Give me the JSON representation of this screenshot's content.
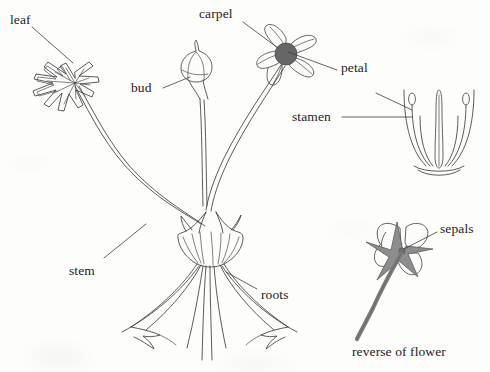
{
  "figure": {
    "caption": "reverse of flower",
    "background_color": "#fdfdfc",
    "ink_color": "#3a3a3a",
    "carpel_fill": "#666666",
    "sepal_fill": "#8a8a8a",
    "stem_fill": "#7d7d7d"
  },
  "labels": {
    "leaf": "leaf",
    "bud": "bud",
    "carpel": "carpel",
    "petal": "petal",
    "stamen": "stamen",
    "stem": "stem",
    "roots": "roots",
    "sepals": "sepals",
    "reverse_of_flower": "reverse of flower"
  },
  "parts": [
    {
      "name": "leaf",
      "label": "leaf",
      "region": "upper-left"
    },
    {
      "name": "bud",
      "label": "bud",
      "region": "upper-center"
    },
    {
      "name": "carpel",
      "label": "carpel",
      "region": "upper-right-flower-center"
    },
    {
      "name": "petal",
      "label": "petal",
      "region": "upper-right-flower"
    },
    {
      "name": "stamen",
      "label": "stamen",
      "region": "right-cross-section"
    },
    {
      "name": "stem",
      "label": "stem",
      "region": "center-left"
    },
    {
      "name": "roots",
      "label": "roots",
      "region": "bottom-center"
    },
    {
      "name": "sepals",
      "label": "sepals",
      "region": "lower-right"
    }
  ]
}
